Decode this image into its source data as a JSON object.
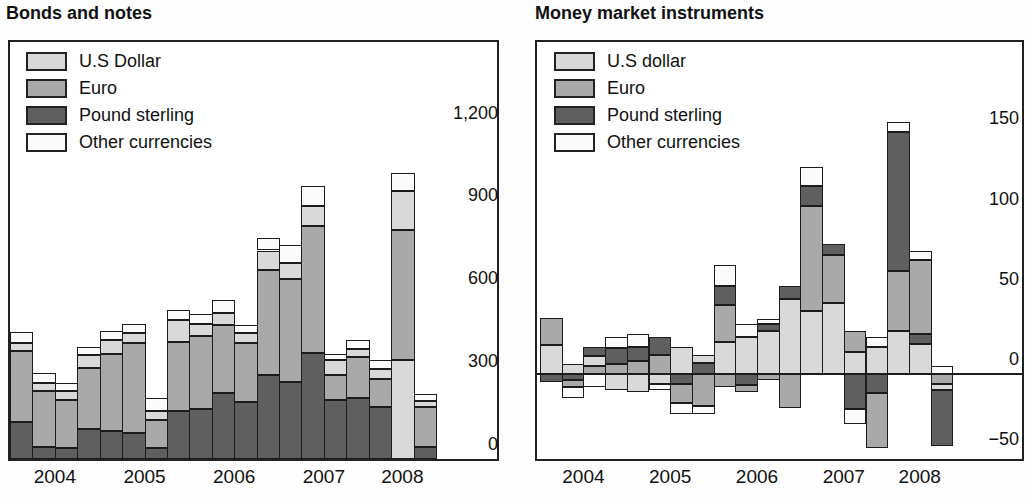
{
  "colors": {
    "usd": "#d9d9d9",
    "euro": "#a9a9a9",
    "pound": "#5f5f5f",
    "other": "#fbfbfb",
    "segment_border": "#1c1c1c",
    "frame_border": "#222222"
  },
  "charts": [
    {
      "title": "Bonds and notes",
      "legend": [
        {
          "key": "usd",
          "label": "U.S Dollar"
        },
        {
          "key": "euro",
          "label": "Euro"
        },
        {
          "key": "pound",
          "label": "Pound sterling"
        },
        {
          "key": "other",
          "label": "Other currencies"
        }
      ],
      "y_tick_labels": [
        "0",
        "300",
        "600",
        "900",
        "1,200"
      ],
      "x_year_labels": [
        "2004",
        "2005",
        "2006",
        "2007",
        "2008"
      ],
      "chart_data": {
        "type": "bar",
        "stacked": true,
        "ylim": [
          0,
          1510
        ],
        "y_ticks": [
          0,
          300,
          600,
          900,
          1200
        ],
        "grid": false,
        "legend_position": "top-left-inside",
        "bars": [
          {
            "q": "2004 Q1",
            "pos": [
              [
                "pound",
                135
              ],
              [
                "euro",
                255
              ],
              [
                "usd",
                30
              ],
              [
                "other",
                40
              ]
            ],
            "neg": []
          },
          {
            "q": "2004 Q2",
            "pos": [
              [
                "pound",
                45
              ],
              [
                "euro",
                200
              ],
              [
                "usd",
                30
              ],
              [
                "other",
                35
              ]
            ],
            "neg": []
          },
          {
            "q": "2004 Q3",
            "pos": [
              [
                "pound",
                40
              ],
              [
                "euro",
                175
              ],
              [
                "usd",
                30
              ],
              [
                "other",
                30
              ]
            ],
            "neg": []
          },
          {
            "q": "2004 Q4",
            "pos": [
              [
                "pound",
                110
              ],
              [
                "euro",
                220
              ],
              [
                "usd",
                45
              ],
              [
                "other",
                30
              ]
            ],
            "neg": []
          },
          {
            "q": "2005 Q1",
            "pos": [
              [
                "pound",
                100
              ],
              [
                "euro",
                280
              ],
              [
                "usd",
                50
              ],
              [
                "other",
                35
              ]
            ],
            "neg": []
          },
          {
            "q": "2005 Q2",
            "pos": [
              [
                "pound",
                95
              ],
              [
                "euro",
                325
              ],
              [
                "usd",
                35
              ],
              [
                "other",
                35
              ]
            ],
            "neg": []
          },
          {
            "q": "2005 Q3",
            "pos": [
              [
                "pound",
                40
              ],
              [
                "euro",
                100
              ],
              [
                "usd",
                35
              ],
              [
                "other",
                45
              ]
            ],
            "neg": []
          },
          {
            "q": "2005 Q4",
            "pos": [
              [
                "pound",
                175
              ],
              [
                "euro",
                250
              ],
              [
                "usd",
                80
              ],
              [
                "other",
                35
              ]
            ],
            "neg": []
          },
          {
            "q": "2006 Q1",
            "pos": [
              [
                "pound",
                180
              ],
              [
                "euro",
                265
              ],
              [
                "usd",
                45
              ],
              [
                "other",
                35
              ]
            ],
            "neg": []
          },
          {
            "q": "2006 Q2",
            "pos": [
              [
                "pound",
                240
              ],
              [
                "euro",
                245
              ],
              [
                "usd",
                45
              ],
              [
                "other",
                45
              ]
            ],
            "neg": []
          },
          {
            "q": "2006 Q3",
            "pos": [
              [
                "pound",
                205
              ],
              [
                "euro",
                215
              ],
              [
                "usd",
                35
              ],
              [
                "other",
                30
              ]
            ],
            "neg": []
          },
          {
            "q": "2006 Q4",
            "pos": [
              [
                "pound",
                305
              ],
              [
                "euro",
                380
              ],
              [
                "usd",
                70
              ],
              [
                "other",
                45
              ]
            ],
            "neg": []
          },
          {
            "q": "2007 Q1",
            "pos": [
              [
                "pound",
                280
              ],
              [
                "euro",
                370
              ],
              [
                "usd",
                60
              ],
              [
                "other",
                65
              ]
            ],
            "neg": []
          },
          {
            "q": "2007 Q2",
            "pos": [
              [
                "pound",
                385
              ],
              [
                "euro",
                460
              ],
              [
                "usd",
                70
              ],
              [
                "other",
                75
              ]
            ],
            "neg": []
          },
          {
            "q": "2007 Q3",
            "pos": [
              [
                "pound",
                215
              ],
              [
                "euro",
                90
              ],
              [
                "usd",
                55
              ],
              [
                "other",
                20
              ]
            ],
            "neg": []
          },
          {
            "q": "2007 Q4",
            "pos": [
              [
                "pound",
                220
              ],
              [
                "euro",
                150
              ],
              [
                "usd",
                30
              ],
              [
                "other",
                30
              ]
            ],
            "neg": []
          },
          {
            "q": "2008 Q1",
            "pos": [
              [
                "pound",
                190
              ],
              [
                "euro",
                100
              ],
              [
                "usd",
                35
              ],
              [
                "other",
                35
              ]
            ],
            "neg": []
          },
          {
            "q": "2008 Q2",
            "pos": [
              [
                "usd",
                360
              ],
              [
                "euro",
                470
              ],
              [
                "usd",
                140
              ],
              [
                "other",
                65
              ]
            ],
            "neg": []
          },
          {
            "q": "2008 Q3",
            "pos": [
              [
                "pound",
                45
              ],
              [
                "euro",
                145
              ],
              [
                "usd",
                20
              ],
              [
                "other",
                25
              ]
            ],
            "neg": []
          }
        ]
      }
    },
    {
      "title": "Money market instruments",
      "legend": [
        {
          "key": "usd",
          "label": "U.S dollar"
        },
        {
          "key": "euro",
          "label": "Euro"
        },
        {
          "key": "pound",
          "label": "Pound sterling"
        },
        {
          "key": "other",
          "label": "Other currencies"
        }
      ],
      "y_tick_labels": [
        "−50",
        "0",
        "50",
        "100",
        "150"
      ],
      "x_year_labels": [
        "2004",
        "2005",
        "2006",
        "2007",
        "2008"
      ],
      "chart_data": {
        "type": "bar",
        "stacked": true,
        "ylim": [
          -53,
          207
        ],
        "y_ticks": [
          -50,
          0,
          50,
          100,
          150
        ],
        "grid": false,
        "zero_line": true,
        "legend_position": "top-left-inside",
        "bars": [
          {
            "q": "2004 Q1",
            "pos": [
              [
                "usd",
                18
              ],
              [
                "euro",
                17
              ]
            ],
            "neg": [
              [
                "pound",
                5
              ]
            ]
          },
          {
            "q": "2004 Q2",
            "pos": [
              [
                "usd",
                6
              ]
            ],
            "neg": [
              [
                "pound",
                4
              ],
              [
                "euro",
                4
              ],
              [
                "other",
                7
              ]
            ]
          },
          {
            "q": "2004 Q3",
            "pos": [
              [
                "euro",
                5
              ],
              [
                "usd",
                6
              ],
              [
                "pound",
                6
              ]
            ],
            "neg": [
              [
                "other",
                8
              ]
            ]
          },
          {
            "q": "2004 Q4",
            "pos": [
              [
                "euro",
                6
              ],
              [
                "pound",
                10
              ],
              [
                "other",
                7
              ]
            ],
            "neg": [
              [
                "usd",
                10
              ]
            ]
          },
          {
            "q": "2005 Q1",
            "pos": [
              [
                "euro",
                8
              ],
              [
                "pound",
                9
              ],
              [
                "other",
                8
              ]
            ],
            "neg": [
              [
                "usd",
                11
              ]
            ]
          },
          {
            "q": "2005 Q2",
            "pos": [
              [
                "euro",
                12
              ],
              [
                "pound",
                11
              ]
            ],
            "neg": [
              [
                "usd",
                6
              ],
              [
                "other",
                4
              ]
            ]
          },
          {
            "q": "2005 Q3",
            "pos": [
              [
                "usd",
                17
              ]
            ],
            "neg": [
              [
                "pound",
                6
              ],
              [
                "euro",
                12
              ],
              [
                "other",
                7
              ]
            ]
          },
          {
            "q": "2005 Q4",
            "pos": [
              [
                "pound",
                7
              ],
              [
                "usd",
                5
              ]
            ],
            "neg": [
              [
                "euro",
                20
              ],
              [
                "other",
                5
              ]
            ]
          },
          {
            "q": "2006 Q1",
            "pos": [
              [
                "usd",
                20
              ],
              [
                "euro",
                23
              ],
              [
                "pound",
                12
              ],
              [
                "other",
                13
              ]
            ],
            "neg": [
              [
                "euro",
                8
              ]
            ]
          },
          {
            "q": "2006 Q2",
            "pos": [
              [
                "usd",
                23
              ],
              [
                "other",
                8
              ]
            ],
            "neg": [
              [
                "pound",
                7
              ],
              [
                "euro",
                4
              ]
            ]
          },
          {
            "q": "2006 Q3",
            "pos": [
              [
                "usd",
                27
              ],
              [
                "pound",
                4
              ],
              [
                "other",
                3
              ]
            ],
            "neg": [
              [
                "euro",
                4
              ]
            ]
          },
          {
            "q": "2006 Q4",
            "pos": [
              [
                "usd",
                47
              ],
              [
                "pound",
                8
              ]
            ],
            "neg": [
              [
                "euro",
                21
              ]
            ]
          },
          {
            "q": "2007 Q1",
            "pos": [
              [
                "usd",
                39
              ],
              [
                "euro",
                66
              ],
              [
                "pound",
                12
              ],
              [
                "other",
                12
              ]
            ],
            "neg": []
          },
          {
            "q": "2007 Q2",
            "pos": [
              [
                "usd",
                44
              ],
              [
                "euro",
                30
              ],
              [
                "pound",
                7
              ]
            ],
            "neg": []
          },
          {
            "q": "2007 Q3",
            "pos": [
              [
                "usd",
                14
              ],
              [
                "euro",
                13
              ]
            ],
            "neg": [
              [
                "pound",
                22
              ],
              [
                "other",
                9
              ]
            ]
          },
          {
            "q": "2007 Q4",
            "pos": [
              [
                "usd",
                17
              ],
              [
                "other",
                6
              ]
            ],
            "neg": [
              [
                "pound",
                12
              ],
              [
                "euro",
                34
              ]
            ]
          },
          {
            "q": "2008 Q1",
            "pos": [
              [
                "usd",
                27
              ],
              [
                "euro",
                37
              ],
              [
                "pound",
                87
              ],
              [
                "other",
                6
              ]
            ],
            "neg": []
          },
          {
            "q": "2008 Q2",
            "pos": [
              [
                "usd",
                19
              ],
              [
                "pound",
                6
              ],
              [
                "euro",
                46
              ],
              [
                "other",
                6
              ]
            ],
            "neg": []
          },
          {
            "q": "2008 Q3",
            "pos": [
              [
                "other",
                5
              ]
            ],
            "neg": [
              [
                "euro",
                6
              ],
              [
                "usd",
                4
              ],
              [
                "pound",
                35
              ]
            ]
          }
        ]
      }
    }
  ]
}
